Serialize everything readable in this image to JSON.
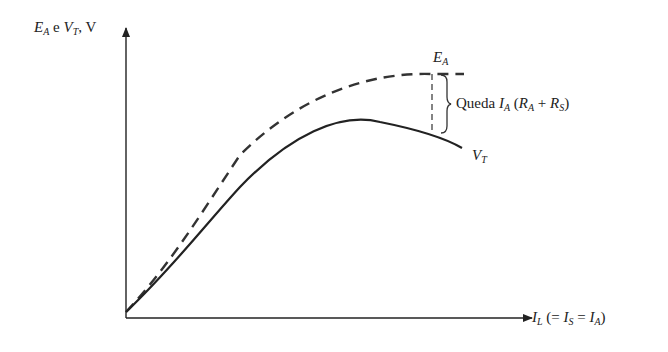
{
  "diagram": {
    "y_axis_label": {
      "e_sym": "E",
      "e_sub": "A",
      "conj": " e ",
      "v_sym": "V",
      "v_sub": "T",
      "unit": ", V"
    },
    "x_axis_label": {
      "i": "I",
      "l_sub": "L",
      "open": " (= ",
      "is": "I",
      "s_sub": "S",
      "eq": " = ",
      "ia": "I",
      "a_sub": "A",
      "close": ")"
    },
    "curve_ea_label": {
      "sym": "E",
      "sub": "A"
    },
    "curve_vt_label": {
      "sym": "V",
      "sub": "T"
    },
    "drop_label": {
      "text": "Queda ",
      "i": "I",
      "i_sub": "A",
      "open": " (",
      "ra": "R",
      "ra_sub": "A",
      "plus": " + ",
      "rs": "R",
      "rs_sub": "S",
      "close": ")"
    },
    "colors": {
      "line": "#222222",
      "background": "#ffffff"
    }
  }
}
